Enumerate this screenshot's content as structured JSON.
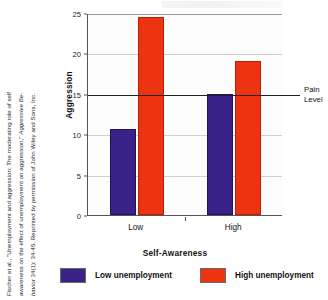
{
  "citation": {
    "line1": "Fischer et al., \"Unemployment and aggression: The moderating role of self",
    "line2_plain": "awareness on the effect of unemployment on aggression,\" ",
    "line2_italic": "Aggressive Be-",
    "line3_italic": "havior",
    "line3_plain": " 34(1): 34-45. Reprinted by permission of John Wiley and Sons, Inc."
  },
  "chart_data": {
    "type": "bar",
    "title": "",
    "xlabel": "Self-Awareness",
    "ylabel": "Aggression",
    "categories": [
      "Low",
      "High"
    ],
    "ylim": [
      0,
      25
    ],
    "yticks": [
      0,
      5,
      10,
      15,
      20,
      25
    ],
    "ytick_labels": [
      "0",
      "5",
      "10",
      "15",
      "20",
      "25"
    ],
    "grid": true,
    "legend_position": "bottom",
    "series": [
      {
        "name": "Low unemployment",
        "color": "#3B2288",
        "values": [
          10.6,
          15.0
        ]
      },
      {
        "name": "High unemployment",
        "color": "#EE3311",
        "values": [
          24.5,
          19.0
        ]
      }
    ],
    "annotations": [
      {
        "name": "pain-level-line",
        "label_line1": "Pain",
        "label_line2": "Level",
        "y_value": 15
      }
    ]
  }
}
